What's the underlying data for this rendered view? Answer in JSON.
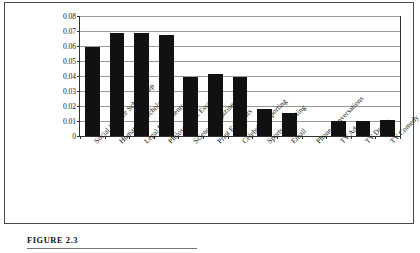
{
  "figure": {
    "caption": "FIGURE 2.3"
  },
  "chart_data": {
    "type": "bar",
    "title": "",
    "xlabel": "",
    "ylabel": "",
    "ylim": [
      0,
      0.08
    ],
    "grid": true,
    "legend": "none",
    "y_ticks": [
      "0",
      "0.01",
      "0.02",
      "0.03",
      "0.04",
      "0.05",
      "0.06",
      "0.07",
      "0.08"
    ],
    "y_tick_values": [
      0,
      0.01,
      0.02,
      0.03,
      0.04,
      0.05,
      0.06,
      0.07,
      0.08
    ],
    "categories": [
      "Social Science Scholarship",
      "Humanities Scholarship",
      "Legal Documents",
      "Philosophical Essays",
      "Science Magazines",
      "Print Editorials",
      "Celebrity Reporting",
      "Sports Reporting",
      "Email",
      "Phone Conversations",
      "TV Ads",
      "TV Drama",
      "TV Comedy"
    ],
    "values": [
      0.0595,
      0.0685,
      0.0685,
      0.0675,
      0.0395,
      0.0413,
      0.0393,
      0.0183,
      0.0155,
      0.0,
      0.01,
      0.0103,
      0.011
    ],
    "bar_color": "#111111"
  }
}
